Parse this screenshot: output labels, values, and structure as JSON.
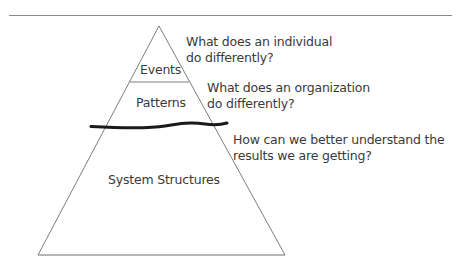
{
  "diagram": {
    "levels": [
      {
        "label": "Events",
        "question_line1": "What does an individual",
        "question_line2": "do differently?"
      },
      {
        "label": "Patterns",
        "question_line1": "What does an organization",
        "question_line2": "do differently?"
      },
      {
        "label": "System Structures",
        "question_line1": "How can we better understand the",
        "question_line2": "results we are getting?"
      }
    ],
    "waterline": "wavy divider between visible and hidden levels",
    "colors": {
      "line": "#7a7a7a",
      "waterline": "#1a1a1a",
      "text": "#3a3a3a"
    }
  }
}
